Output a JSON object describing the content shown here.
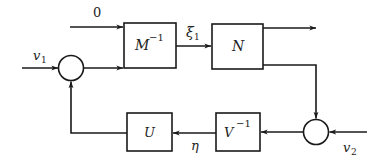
{
  "diagram": {
    "type": "block-diagram",
    "colors": {
      "stroke": "#1a1a1a",
      "background": "#ffffff",
      "text": "#222222"
    },
    "blocks": [
      {
        "id": "M_inv",
        "label_base": "M",
        "label_sup": "−1"
      },
      {
        "id": "N",
        "label_base": "N",
        "label_sup": ""
      },
      {
        "id": "V_inv",
        "label_base": "V",
        "label_sup": "−1"
      },
      {
        "id": "U",
        "label_base": "U",
        "label_sup": ""
      }
    ],
    "summing_junctions": [
      {
        "id": "sum_left"
      },
      {
        "id": "sum_right"
      }
    ],
    "signals": {
      "zero_input": "0",
      "v1": {
        "base": "v",
        "sub": "1"
      },
      "v2": {
        "base": "v",
        "sub": "2"
      },
      "xi1": {
        "base": "ξ",
        "sub": "1"
      },
      "eta": "η"
    },
    "connections": [
      {
        "from": "zero_input",
        "to": "M_inv"
      },
      {
        "from": "v1",
        "to": "sum_left"
      },
      {
        "from": "sum_left",
        "to": "M_inv"
      },
      {
        "from": "M_inv",
        "to": "N",
        "label": "ξ1"
      },
      {
        "from": "N",
        "to": "output"
      },
      {
        "from": "N",
        "to": "sum_right"
      },
      {
        "from": "v2",
        "to": "sum_right"
      },
      {
        "from": "sum_right",
        "to": "V_inv"
      },
      {
        "from": "V_inv",
        "to": "U",
        "label": "η"
      },
      {
        "from": "U",
        "to": "sum_left"
      }
    ]
  }
}
